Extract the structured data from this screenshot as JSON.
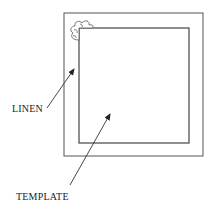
{
  "diagram": {
    "labels": {
      "linen": "LINEN",
      "template": "TEMPLATE"
    },
    "colors": {
      "stroke": "#444444",
      "background": "#ffffff"
    }
  }
}
